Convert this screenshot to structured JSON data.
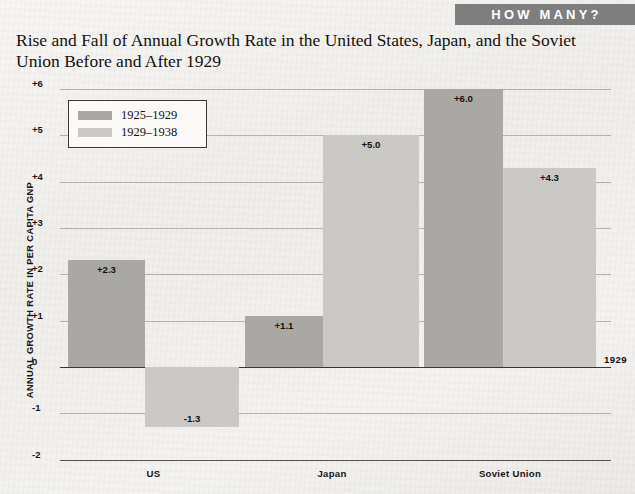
{
  "banner": {
    "label": "HOW MANY?"
  },
  "title": "Rise and Fall of Annual Growth Rate in the United States, Japan, and the Soviet Union Before and After 1929",
  "year_marker": "1929",
  "legend": {
    "series": [
      {
        "label": "1925–1929",
        "color": "#a9a8a5"
      },
      {
        "label": "1929–1938",
        "color": "#cac9c5"
      }
    ]
  },
  "chart_data": {
    "type": "bar",
    "title": "Rise and Fall of Annual Growth Rate in the United States, Japan, and the Soviet Union Before and After 1929",
    "xlabel": "",
    "ylabel": "ANNUAL GROWTH RATE IN PER CAPITA GNP",
    "categories": [
      "US",
      "Japan",
      "Soviet Union"
    ],
    "series": [
      {
        "name": "1925–1929",
        "color": "#a9a8a5",
        "values": [
          2.3,
          1.1,
          6.0
        ],
        "labels": [
          "+2.3",
          "+1.1",
          "+6.0"
        ]
      },
      {
        "name": "1929–1938",
        "color": "#cac9c5",
        "values": [
          -1.3,
          5.0,
          4.3
        ],
        "labels": [
          "-1.3",
          "+5.0",
          "+4.3"
        ]
      }
    ],
    "ylim": [
      -2,
      6
    ],
    "yticks": [
      6,
      5,
      4,
      3,
      2,
      1,
      0,
      -1,
      -2
    ],
    "ytick_labels": [
      "+6",
      "+5",
      "+4",
      "+3",
      "+2",
      "+1",
      "0",
      "-1",
      "-2"
    ],
    "grid": true,
    "legend_position": "top-left",
    "annotations": [
      "1929"
    ]
  }
}
